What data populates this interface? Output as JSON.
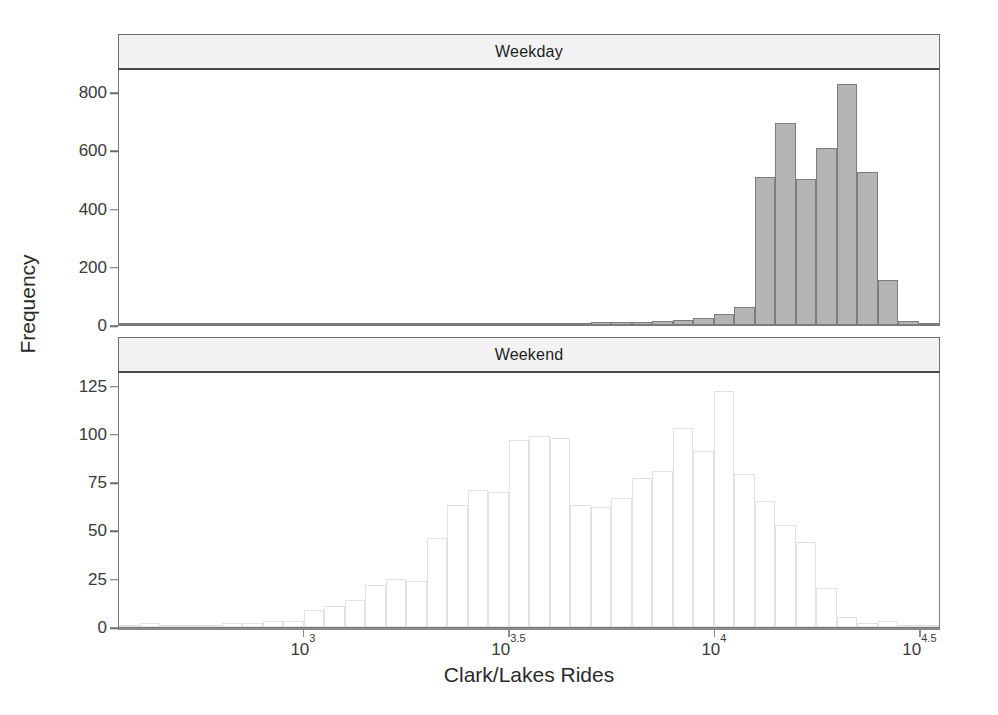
{
  "figure": {
    "xlabel": "Clark/Lakes Rides",
    "ylabel": "Frequency",
    "background": "#ffffff",
    "weekday_bar_fill": "#b4b4b4",
    "weekday_bar_stroke": "#7d7d7d",
    "weekend_bar_fill": "#ffffff",
    "weekend_bar_stroke": "#e2e2e2",
    "strip_fill": "#f2f2f2"
  },
  "xaxis": {
    "scale": "log10",
    "ticks": [
      {
        "label_base": "10",
        "label_exp": "3",
        "value": 3.0
      },
      {
        "label_base": "10",
        "label_exp": "3.5",
        "value": 3.5
      },
      {
        "label_base": "10",
        "label_exp": "4",
        "value": 4.0
      },
      {
        "label_base": "10",
        "label_exp": "4.5",
        "value": 4.5
      }
    ],
    "range": [
      2.55,
      4.55
    ]
  },
  "chart_data": [
    {
      "type": "bar",
      "panel": "Weekday",
      "title": "Weekday",
      "xlabel": "Clark/Lakes Rides",
      "ylabel": "Frequency",
      "xscale": "log10",
      "xlim": [
        2.55,
        4.55
      ],
      "ylim": [
        0,
        880
      ],
      "yticks": [
        0,
        200,
        400,
        600,
        800
      ],
      "grid": false,
      "bin_width": 0.05,
      "bin_starts": [
        2.55,
        2.6,
        2.65,
        2.7,
        2.75,
        2.8,
        2.85,
        2.9,
        2.95,
        3.0,
        3.05,
        3.1,
        3.15,
        3.2,
        3.25,
        3.3,
        3.35,
        3.4,
        3.45,
        3.5,
        3.55,
        3.6,
        3.65,
        3.7,
        3.75,
        3.8,
        3.85,
        3.9,
        3.95,
        4.0,
        4.05,
        4.1,
        4.15,
        4.2,
        4.25,
        4.3,
        4.35,
        4.4,
        4.45,
        4.5
      ],
      "values": [
        1,
        1,
        1,
        1,
        2,
        2,
        2,
        2,
        3,
        3,
        4,
        4,
        4,
        5,
        5,
        5,
        6,
        8,
        8,
        7,
        6,
        7,
        8,
        9,
        10,
        11,
        13,
        16,
        24,
        39,
        62,
        508,
        695,
        502,
        607,
        830,
        527,
        156,
        14,
        4
      ],
      "categories": [
        "2.55",
        "2.60",
        "2.65",
        "2.70",
        "2.75",
        "2.80",
        "2.85",
        "2.90",
        "2.95",
        "3.00",
        "3.05",
        "3.10",
        "3.15",
        "3.20",
        "3.25",
        "3.30",
        "3.35",
        "3.40",
        "3.45",
        "3.50",
        "3.55",
        "3.60",
        "3.65",
        "3.70",
        "3.75",
        "3.80",
        "3.85",
        "3.90",
        "3.95",
        "4.00",
        "4.05",
        "4.10",
        "4.15",
        "4.20",
        "4.25",
        "4.30",
        "4.35",
        "4.40",
        "4.45",
        "4.50"
      ]
    },
    {
      "type": "bar",
      "panel": "Weekend",
      "title": "Weekend",
      "xlabel": "Clark/Lakes Rides",
      "ylabel": "Frequency",
      "xscale": "log10",
      "xlim": [
        2.55,
        4.55
      ],
      "ylim": [
        0,
        132
      ],
      "yticks": [
        0,
        25,
        50,
        75,
        100,
        125
      ],
      "grid": false,
      "bin_width": 0.05,
      "bin_starts": [
        2.55,
        2.6,
        2.65,
        2.7,
        2.75,
        2.8,
        2.85,
        2.9,
        2.95,
        3.0,
        3.05,
        3.1,
        3.15,
        3.2,
        3.25,
        3.3,
        3.35,
        3.4,
        3.45,
        3.5,
        3.55,
        3.6,
        3.65,
        3.7,
        3.75,
        3.8,
        3.85,
        3.9,
        3.95,
        4.0,
        4.05,
        4.1,
        4.15,
        4.2,
        4.25,
        4.3,
        4.35,
        4.4,
        4.45,
        4.5
      ],
      "values": [
        1,
        2,
        1,
        1,
        1,
        2,
        2,
        3,
        3,
        9,
        11,
        14,
        22,
        25,
        24,
        46,
        63,
        71,
        70,
        97,
        99,
        98,
        63,
        62,
        67,
        77,
        81,
        103,
        91,
        122,
        79,
        65,
        53,
        44,
        20,
        5,
        2,
        3,
        1,
        0
      ],
      "categories": [
        "2.55",
        "2.60",
        "2.65",
        "2.70",
        "2.75",
        "2.80",
        "2.85",
        "2.90",
        "2.95",
        "3.00",
        "3.05",
        "3.10",
        "3.15",
        "3.20",
        "3.25",
        "3.30",
        "3.35",
        "3.40",
        "3.45",
        "3.50",
        "3.55",
        "3.60",
        "3.65",
        "3.70",
        "3.75",
        "3.80",
        "3.85",
        "3.90",
        "3.95",
        "4.00",
        "4.05",
        "4.10",
        "4.15",
        "4.20",
        "4.25",
        "4.30",
        "4.35",
        "4.40",
        "4.45",
        "4.50"
      ]
    }
  ]
}
